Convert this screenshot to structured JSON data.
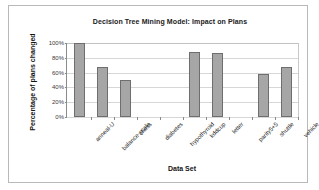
{
  "chart_data": {
    "type": "bar",
    "title": "Decision Tree Mining Model: Impact on Plans",
    "xlabel": "Data Set",
    "ylabel": "Percentage of plans changed",
    "categories": [
      "anneal-U",
      "balance-scale",
      "chess",
      "diabetes",
      "hypothyroid",
      "kddcup",
      "letter",
      "parity5+5",
      "shuttle",
      "vehicle"
    ],
    "values": [
      100,
      67,
      50,
      0,
      0,
      88,
      86,
      0,
      58,
      68
    ],
    "ylim": [
      0,
      100
    ],
    "yticks": [
      0,
      20,
      40,
      60,
      80,
      100
    ],
    "ytick_labels": [
      "0%",
      "20%",
      "40%",
      "60%",
      "80%",
      "100%"
    ],
    "grid": true,
    "legend": false,
    "bar_color": "#a6a6a6",
    "bar_edge_color": "#6e6e6e",
    "grid_color": "#d6d6d6",
    "axis_color": "#8a8a8a",
    "background": "#ffffff"
  }
}
